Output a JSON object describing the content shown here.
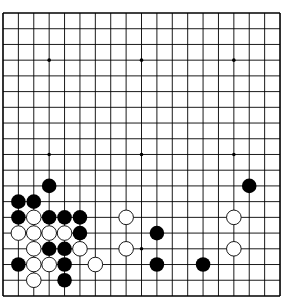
{
  "board": {
    "size": 19,
    "origin_x": 3,
    "origin_y": 13,
    "step_x": 15.39,
    "step_y": 15.72,
    "line_color": "#000000",
    "background": "#ffffff",
    "star_points": [
      [
        3,
        3
      ],
      [
        9,
        3
      ],
      [
        15,
        3
      ],
      [
        3,
        9
      ],
      [
        9,
        9
      ],
      [
        15,
        9
      ],
      [
        3,
        15
      ],
      [
        9,
        15
      ],
      [
        15,
        15
      ]
    ],
    "stones": [
      {
        "color": "black",
        "col": 3,
        "row": 11
      },
      {
        "color": "black",
        "col": 1,
        "row": 12
      },
      {
        "color": "black",
        "col": 2,
        "row": 12
      },
      {
        "color": "black",
        "col": 1,
        "row": 13
      },
      {
        "color": "white",
        "col": 2,
        "row": 13
      },
      {
        "color": "black",
        "col": 3,
        "row": 13
      },
      {
        "color": "black",
        "col": 4,
        "row": 13
      },
      {
        "color": "black",
        "col": 5,
        "row": 13
      },
      {
        "color": "white",
        "col": 1,
        "row": 14
      },
      {
        "color": "white",
        "col": 2,
        "row": 14
      },
      {
        "color": "white",
        "col": 3,
        "row": 14
      },
      {
        "color": "white",
        "col": 4,
        "row": 14
      },
      {
        "color": "black",
        "col": 5,
        "row": 14
      },
      {
        "color": "white",
        "col": 2,
        "row": 15
      },
      {
        "color": "black",
        "col": 3,
        "row": 15
      },
      {
        "color": "black",
        "col": 4,
        "row": 15
      },
      {
        "color": "white",
        "col": 5,
        "row": 15
      },
      {
        "color": "black",
        "col": 1,
        "row": 16
      },
      {
        "color": "white",
        "col": 2,
        "row": 16
      },
      {
        "color": "white",
        "col": 3,
        "row": 16
      },
      {
        "color": "black",
        "col": 4,
        "row": 16
      },
      {
        "color": "white",
        "col": 6,
        "row": 16
      },
      {
        "color": "white",
        "col": 2,
        "row": 17
      },
      {
        "color": "black",
        "col": 4,
        "row": 17
      },
      {
        "color": "white",
        "col": 8,
        "row": 13
      },
      {
        "color": "white",
        "col": 8,
        "row": 15
      },
      {
        "color": "black",
        "col": 10,
        "row": 14
      },
      {
        "color": "black",
        "col": 10,
        "row": 16
      },
      {
        "color": "black",
        "col": 13,
        "row": 16
      },
      {
        "color": "black",
        "col": 16,
        "row": 11
      },
      {
        "color": "white",
        "col": 15,
        "row": 13
      },
      {
        "color": "white",
        "col": 15,
        "row": 15
      }
    ]
  }
}
